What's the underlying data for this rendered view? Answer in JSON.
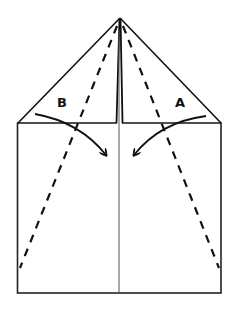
{
  "diagram": {
    "type": "paper-folding-instruction",
    "labels": {
      "left_flap": "B",
      "right_flap": "A"
    },
    "elements": [
      {
        "kind": "outline",
        "shape": "rectangle",
        "description": "sheet of paper body"
      },
      {
        "kind": "outline",
        "shape": "triangle",
        "description": "folded top point"
      },
      {
        "kind": "crease",
        "style": "solid",
        "description": "center crease line"
      },
      {
        "kind": "fold-line",
        "style": "dashed",
        "description": "left valley fold from apex to lower left"
      },
      {
        "kind": "fold-line",
        "style": "dashed",
        "description": "right valley fold from apex to lower right"
      },
      {
        "kind": "arrow",
        "description": "fold flap B toward center"
      },
      {
        "kind": "arrow",
        "description": "fold flap A toward center"
      }
    ]
  }
}
